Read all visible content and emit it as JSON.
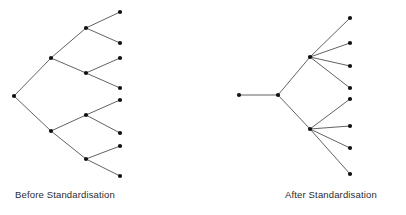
{
  "figure": {
    "width": 406,
    "height": 215,
    "background_color": "#ffffff",
    "edge_color": "#3a3a3a",
    "node_color": "#111111",
    "node_radius": 2.1,
    "edge_width": 0.8
  },
  "panels": [
    {
      "id": "before",
      "caption": "Before Standardisation",
      "caption_position": {
        "x": 15,
        "y": 189
      },
      "graph_type": "binary-tree",
      "nodes": [
        {
          "id": "b-root",
          "x": 14,
          "y": 96,
          "level": 0
        },
        {
          "id": "b-u",
          "x": 51,
          "y": 58,
          "level": 1
        },
        {
          "id": "b-l",
          "x": 51,
          "y": 131,
          "level": 1
        },
        {
          "id": "b-uu",
          "x": 86,
          "y": 28,
          "level": 2
        },
        {
          "id": "b-ul",
          "x": 86,
          "y": 73,
          "level": 2
        },
        {
          "id": "b-lu",
          "x": 86,
          "y": 115,
          "level": 2
        },
        {
          "id": "b-ll",
          "x": 86,
          "y": 159,
          "level": 2
        },
        {
          "id": "b-leaf1",
          "x": 120,
          "y": 12,
          "level": 3
        },
        {
          "id": "b-leaf2",
          "x": 120,
          "y": 43,
          "level": 3
        },
        {
          "id": "b-leaf3",
          "x": 120,
          "y": 58,
          "level": 3
        },
        {
          "id": "b-leaf4",
          "x": 120,
          "y": 88,
          "level": 3
        },
        {
          "id": "b-leaf5",
          "x": 120,
          "y": 100,
          "level": 3
        },
        {
          "id": "b-leaf6",
          "x": 120,
          "y": 133,
          "level": 3
        },
        {
          "id": "b-leaf7",
          "x": 120,
          "y": 146,
          "level": 3
        },
        {
          "id": "b-leaf8",
          "x": 120,
          "y": 176,
          "level": 3
        }
      ],
      "edges": [
        {
          "from": "b-root",
          "to": "b-u"
        },
        {
          "from": "b-root",
          "to": "b-l"
        },
        {
          "from": "b-u",
          "to": "b-uu"
        },
        {
          "from": "b-u",
          "to": "b-ul"
        },
        {
          "from": "b-l",
          "to": "b-lu"
        },
        {
          "from": "b-l",
          "to": "b-ll"
        },
        {
          "from": "b-uu",
          "to": "b-leaf1"
        },
        {
          "from": "b-uu",
          "to": "b-leaf2"
        },
        {
          "from": "b-ul",
          "to": "b-leaf3"
        },
        {
          "from": "b-ul",
          "to": "b-leaf4"
        },
        {
          "from": "b-lu",
          "to": "b-leaf5"
        },
        {
          "from": "b-lu",
          "to": "b-leaf6"
        },
        {
          "from": "b-ll",
          "to": "b-leaf7"
        },
        {
          "from": "b-ll",
          "to": "b-leaf8"
        }
      ]
    },
    {
      "id": "after",
      "caption": "After Standardisation",
      "caption_position": {
        "x": 285,
        "y": 189
      },
      "graph_type": "star-tree",
      "nodes": [
        {
          "id": "a-root",
          "x": 239,
          "y": 95,
          "level": 0
        },
        {
          "id": "a-mid",
          "x": 278,
          "y": 95,
          "level": 1
        },
        {
          "id": "a-hubu",
          "x": 310,
          "y": 57,
          "level": 2
        },
        {
          "id": "a-hubl",
          "x": 310,
          "y": 129,
          "level": 2
        },
        {
          "id": "a-leaf1",
          "x": 350,
          "y": 18,
          "level": 3
        },
        {
          "id": "a-leaf2",
          "x": 350,
          "y": 43,
          "level": 3
        },
        {
          "id": "a-leaf3",
          "x": 350,
          "y": 66,
          "level": 3
        },
        {
          "id": "a-leaf4",
          "x": 350,
          "y": 88,
          "level": 3
        },
        {
          "id": "a-leaf5",
          "x": 350,
          "y": 99,
          "level": 3
        },
        {
          "id": "a-leaf6",
          "x": 350,
          "y": 126,
          "level": 3
        },
        {
          "id": "a-leaf7",
          "x": 350,
          "y": 148,
          "level": 3
        },
        {
          "id": "a-leaf8",
          "x": 350,
          "y": 174,
          "level": 3
        }
      ],
      "edges": [
        {
          "from": "a-root",
          "to": "a-mid"
        },
        {
          "from": "a-mid",
          "to": "a-hubu"
        },
        {
          "from": "a-mid",
          "to": "a-hubl"
        },
        {
          "from": "a-hubu",
          "to": "a-leaf1"
        },
        {
          "from": "a-hubu",
          "to": "a-leaf2"
        },
        {
          "from": "a-hubu",
          "to": "a-leaf3"
        },
        {
          "from": "a-hubu",
          "to": "a-leaf4"
        },
        {
          "from": "a-hubl",
          "to": "a-leaf5"
        },
        {
          "from": "a-hubl",
          "to": "a-leaf6"
        },
        {
          "from": "a-hubl",
          "to": "a-leaf7"
        },
        {
          "from": "a-hubl",
          "to": "a-leaf8"
        }
      ]
    }
  ]
}
